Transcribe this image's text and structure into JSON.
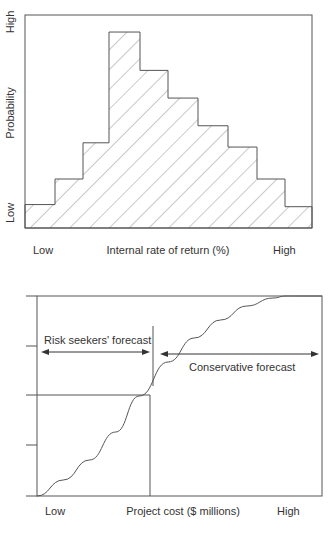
{
  "chart_data": [
    {
      "type": "bar",
      "subtype": "histogram",
      "title": "",
      "xlabel": "Internal rate of return (%)",
      "ylabel": "Probability",
      "x_tick_labels": {
        "low": "Low",
        "high": "High"
      },
      "y_tick_labels": {
        "low": "Low",
        "high": "High"
      },
      "fill": "diagonal hatching",
      "grid": false,
      "categories": [
        "1",
        "2",
        "3",
        "4",
        "5",
        "6",
        "7",
        "8",
        "9",
        "10"
      ],
      "values": [
        1.1,
        2.3,
        4.0,
        9.2,
        7.4,
        6.1,
        4.8,
        3.8,
        2.3,
        1.0
      ],
      "ylim": [
        0,
        10
      ]
    },
    {
      "type": "line",
      "subtype": "cumulative probability (S-curve)",
      "title": "",
      "xlabel": "Project cost ($ millions)",
      "ylabel": "",
      "x_tick_labels": {
        "low": "Low",
        "high": "High"
      },
      "y_ticks": [
        0,
        0.25,
        0.5,
        0.75,
        1.0
      ],
      "x": [
        0,
        0.1,
        0.2,
        0.3,
        0.39,
        0.5,
        0.6,
        0.7,
        0.8,
        0.9,
        0.95,
        1.0
      ],
      "y": [
        0,
        0.08,
        0.18,
        0.32,
        0.5,
        0.67,
        0.79,
        0.88,
        0.95,
        0.99,
        1.0,
        1.0
      ],
      "reference_lines": {
        "x": 0.39,
        "y": 0.5
      },
      "annotations": [
        {
          "text": "Risk seekers' forecast",
          "range": "left of median",
          "arrow": "double-headed"
        },
        {
          "text": "Conservative forecast",
          "range": "right of median",
          "arrow": "double-headed"
        }
      ],
      "grid": false
    }
  ],
  "hist": {
    "ylabel": "Probability",
    "y_high": "High",
    "y_low": "Low",
    "x_low": "Low",
    "x_high": "High",
    "xlabel": "Internal rate of return (%)"
  },
  "scurve": {
    "risk_label": "Risk seekers' forecast",
    "conservative_label": "Conservative forecast",
    "x_low": "Low",
    "x_high": "High",
    "xlabel": "Project cost ($ millions)"
  },
  "colors": {
    "line": "#555555",
    "hatch": "#777777"
  }
}
